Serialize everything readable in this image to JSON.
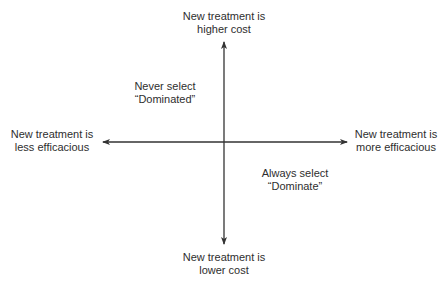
{
  "diagram": {
    "type": "cost-effectiveness-plane",
    "axes": {
      "vertical": {
        "top_label": [
          "New treatment is",
          "higher cost"
        ],
        "bottom_label": [
          "New treatment is",
          "lower cost"
        ]
      },
      "horizontal": {
        "left_label": [
          "New treatment is",
          "less efficacious"
        ],
        "right_label": [
          "New treatment is",
          "more efficacious"
        ]
      }
    },
    "quadrants": {
      "upper_left": [
        "Never select",
        "“Dominated”"
      ],
      "lower_right": [
        "Always select",
        "“Dominate”"
      ]
    },
    "colors": {
      "line": "#333333",
      "text": "#2e2e2e",
      "background": "#ffffff"
    }
  }
}
